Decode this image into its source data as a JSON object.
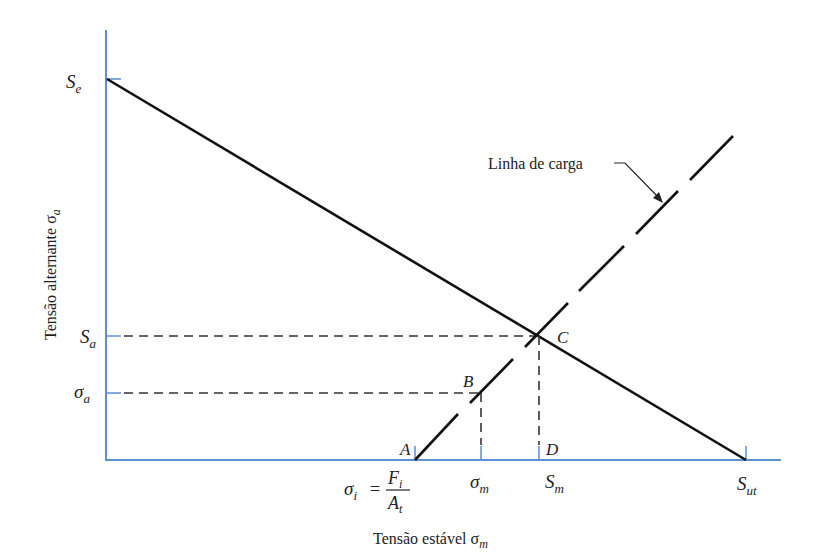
{
  "diagram": {
    "type": "goodman-fatigue-diagram",
    "y_axis_label": "Tensão alternante σ",
    "y_axis_label_sub": "a",
    "x_axis_label": "Tensão estável σ",
    "x_axis_label_sub": "m",
    "colors": {
      "axis": "#5b8fd6",
      "line": "#111111",
      "dashed": "#333333",
      "text": "#222222"
    },
    "y_ticks": [
      {
        "main": "S",
        "sub": "e"
      },
      {
        "main": "S",
        "sub": "a"
      },
      {
        "main": "σ",
        "sub": "a"
      }
    ],
    "x_ticks": [
      {
        "main": "σ",
        "sub": "m"
      },
      {
        "main": "S",
        "sub": "m"
      },
      {
        "main": "S",
        "sub": "ut"
      }
    ],
    "preload_formula": {
      "lhs": "σ",
      "lhs_sub": "i",
      "eq": "=",
      "num": "F",
      "num_sub": "i",
      "den": "A",
      "den_sub": "t"
    },
    "points": {
      "A": "A",
      "B": "B",
      "C": "C",
      "D": "D"
    },
    "load_line_label": "Linha de carga"
  }
}
